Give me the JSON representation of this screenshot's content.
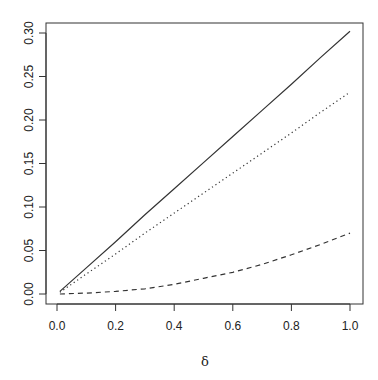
{
  "chart_data": {
    "type": "line",
    "title": "",
    "xlabel": "δ",
    "ylabel": "",
    "xlim": [
      0.0,
      1.0
    ],
    "ylim": [
      0.0,
      0.3
    ],
    "grid": false,
    "legend": null,
    "x_ticks": [
      "0.0",
      "0.2",
      "0.4",
      "0.6",
      "0.8",
      "1.0"
    ],
    "y_ticks": [
      "0.00",
      "0.05",
      "0.10",
      "0.15",
      "0.20",
      "0.25",
      "0.30"
    ],
    "x": [
      0.01,
      0.1,
      0.2,
      0.3,
      0.4,
      0.5,
      0.6,
      0.7,
      0.8,
      0.9,
      1.0
    ],
    "series": [
      {
        "name": "solid",
        "style": "solid",
        "values": [
          0.003,
          0.03,
          0.06,
          0.091,
          0.121,
          0.151,
          0.181,
          0.211,
          0.241,
          0.272,
          0.302
        ]
      },
      {
        "name": "dotted",
        "style": "dotted",
        "values": [
          0.002,
          0.023,
          0.046,
          0.07,
          0.093,
          0.116,
          0.139,
          0.162,
          0.185,
          0.209,
          0.232
        ]
      },
      {
        "name": "dashed",
        "style": "dashed",
        "values": [
          0.0,
          0.001,
          0.003,
          0.006,
          0.011,
          0.018,
          0.025,
          0.034,
          0.045,
          0.057,
          0.07
        ]
      }
    ]
  }
}
